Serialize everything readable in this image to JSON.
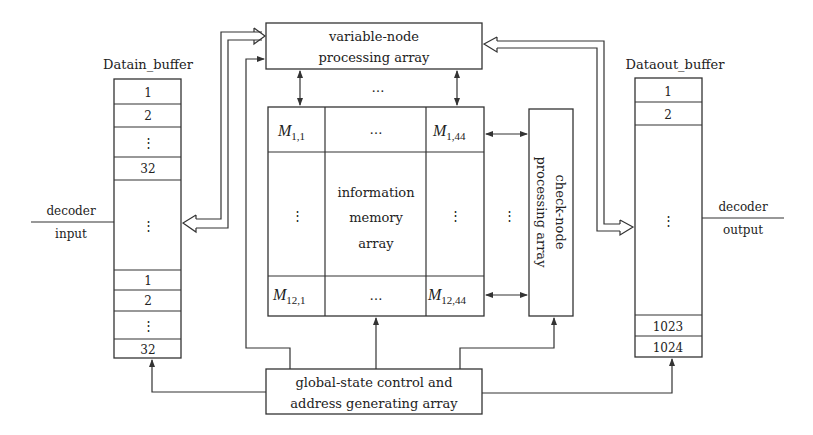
{
  "diagram": {
    "datain_buffer": {
      "title": "Datain_buffer",
      "cells": [
        "1",
        "2",
        "⋮",
        "32",
        "⋮",
        "1",
        "2",
        "⋮",
        "32"
      ]
    },
    "dataout_buffer": {
      "title": "Dataout_buffer",
      "cells": [
        "1",
        "2",
        "⋮",
        "1023",
        "1024"
      ]
    },
    "decoder_input": {
      "line1": "decoder",
      "line2": "input"
    },
    "decoder_output": {
      "line1": "decoder",
      "line2": "output"
    },
    "variable_node": {
      "line1": "variable-node",
      "line2": "processing array"
    },
    "check_node": {
      "line1": "check-node",
      "line2": "processing array"
    },
    "global_control": {
      "line1": "global-state control and",
      "line2": "address generating array"
    },
    "memory_array": {
      "center_line1": "information",
      "center_line2": "memory",
      "center_line3": "array",
      "top_left": {
        "base": "M",
        "sub": "1,1"
      },
      "top_right": {
        "base": "M",
        "sub": "1,44"
      },
      "bottom_left": {
        "base": "M",
        "sub": "12,1"
      },
      "bottom_right": {
        "base": "M",
        "sub": "12,44"
      },
      "ellipsis_h": "…",
      "ellipsis_v": "⋮"
    },
    "ellipsis_between_vn_mem": "…",
    "ellipsis_between_mem_cn": "⋮"
  }
}
